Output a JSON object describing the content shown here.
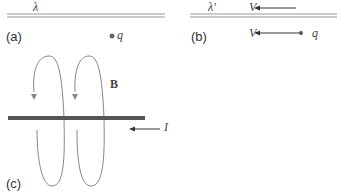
{
  "panels": {
    "a": {
      "label": "(a)",
      "line_charge_symbol": "λ",
      "charge_symbol": "q"
    },
    "b": {
      "label": "(b)",
      "line_charge_symbol": "λ′",
      "line_velocity_symbol": "V",
      "charge_velocity_symbol": "V",
      "charge_symbol": "q"
    },
    "c": {
      "label": "(c)",
      "field_symbol": "B",
      "current_symbol": "I"
    }
  },
  "colors": {
    "line": "#999999",
    "wire": "#555555",
    "loop": "#888888",
    "text": "#333333"
  }
}
